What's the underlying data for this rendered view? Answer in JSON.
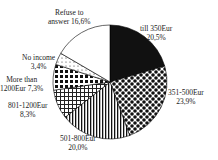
{
  "chart_data": {
    "type": "pie",
    "title": "",
    "categories": [
      "till 350Eur",
      "351-500Eur",
      "501-800Eur",
      "801-1200Eur",
      "More than 1200Eur",
      "No income",
      "Refuse to answer"
    ],
    "values": [
      20.5,
      23.9,
      20.0,
      8.3,
      7.3,
      3.4,
      16.6
    ],
    "labels": [
      {
        "name": "till 350Eur",
        "value": "20,5%"
      },
      {
        "name": "351-500Eur",
        "value": "23,9%"
      },
      {
        "name": "501-800Eur",
        "value": "20,0%"
      },
      {
        "name": "801-1200Eur",
        "value": "8,3%"
      },
      {
        "name": "More than",
        "value": "1200Eur 7,3%"
      },
      {
        "name": "No income",
        "value": "3,4%"
      },
      {
        "name": "Refuse to",
        "value": "answer 16,6%"
      }
    ],
    "start_angle": "12 o'clock",
    "direction": "clockwise"
  }
}
